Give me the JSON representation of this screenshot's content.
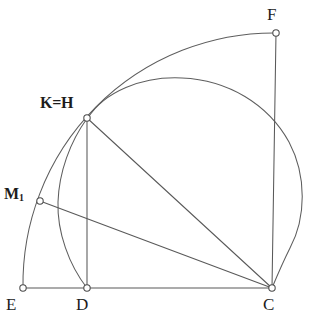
{
  "figure": {
    "canvas": {
      "width": 313,
      "height": 327
    },
    "background_color": "#ffffff",
    "stroke_color": "#595959",
    "label_color": "#1c1c1c",
    "marker_fill": "#ffffff"
  },
  "points": {
    "E": {
      "label": "E",
      "x": 23,
      "y": 288,
      "label_x": 6,
      "label_y": 296,
      "font_size": 17,
      "bold": false
    },
    "D": {
      "label": "D",
      "x": 87,
      "y": 288,
      "label_x": 76,
      "label_y": 296,
      "font_size": 17,
      "bold": false
    },
    "C": {
      "label": "C",
      "x": 272,
      "y": 288,
      "label_x": 263,
      "label_y": 296,
      "font_size": 17,
      "bold": false
    },
    "F": {
      "label": "F",
      "x": 276,
      "y": 33,
      "label_x": 267,
      "label_y": 6,
      "font_size": 17,
      "bold": false
    },
    "KH": {
      "label": "K=H",
      "x": 87,
      "y": 118,
      "label_x": 40,
      "label_y": 95,
      "font_size": 16,
      "bold": true
    },
    "M1": {
      "label": "M",
      "subscript": "1",
      "x": 40,
      "y": 201,
      "label_x": 4,
      "label_y": 183,
      "font_size": 16,
      "bold": true
    }
  },
  "segments": [
    {
      "name": "segment-E-C",
      "from": "E",
      "to": "C"
    },
    {
      "name": "segment-F-C",
      "from": "F",
      "to": "C"
    },
    {
      "name": "segment-KH-D",
      "from": "KH",
      "to": "D"
    },
    {
      "name": "segment-KH-C",
      "from": "KH",
      "to": "C"
    },
    {
      "name": "segment-M1-C",
      "from": "M1",
      "to": "C"
    }
  ],
  "arcs": [
    {
      "name": "arc-E-M1-KH-F",
      "description": "Large arc centered at C from E through M1 and K=H up to F",
      "center_x": 272,
      "center_y": 288,
      "radius": 251,
      "start_x": 23,
      "start_y": 288,
      "end_x": 276,
      "end_y": 33,
      "sweep": 1,
      "large_arc": 0
    },
    {
      "name": "arc-circle-KH-D-C",
      "description": "Circle through K=H, top apex, right bulge and down to C",
      "path": "M 87 118 A 112 112 0 1 1 272 288",
      "apex_x": 190,
      "apex_y": 78,
      "right_x": 302,
      "right_y": 200
    },
    {
      "name": "arc-KH-D",
      "description": "Small arc from K=H bulging left down to D",
      "from_x": 87,
      "from_y": 118,
      "to_x": 87,
      "to_y": 288,
      "radius": 150,
      "sweep": 0,
      "large_arc": 0
    }
  ],
  "marker_radius": 3.2
}
